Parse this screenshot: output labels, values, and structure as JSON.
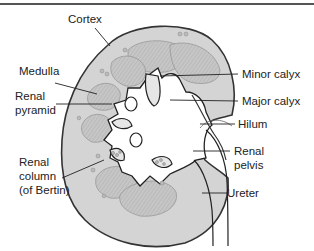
{
  "figure": {
    "labels": {
      "cortex": "Cortex",
      "medulla": "Medulla",
      "renal_pyramid_line1": "Renal",
      "renal_pyramid_line2": "pyramid",
      "renal_column_line1": "Renal",
      "renal_column_line2": "column",
      "renal_column_line3": "(of Bertin)",
      "minor_calyx": "Minor calyx",
      "major_calyx": "Major calyx",
      "hilum": "Hilum",
      "renal_pelvis_line1": "Renal",
      "renal_pelvis_line2": "pelvis",
      "ureter": "Ureter"
    },
    "colors": {
      "cortex_fill": "#d4d4d4",
      "pyramid_fill": "#c2c2c2",
      "sinus_fill": "#ffffff",
      "outline": "#333333",
      "text": "#222222"
    }
  }
}
